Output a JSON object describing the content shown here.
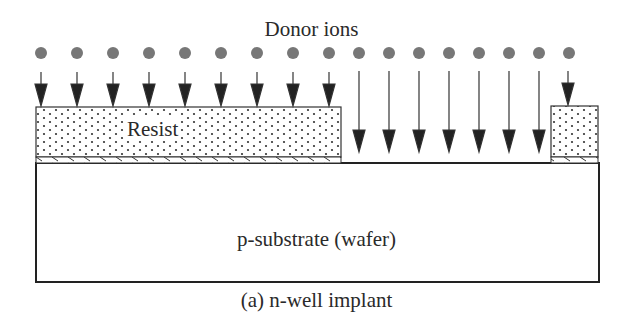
{
  "diagram": {
    "title": "Donor ions",
    "resist_label": "Resist",
    "substrate_label": "p-substrate (wafer)",
    "caption": "(a) n-well implant",
    "ion_count": 17,
    "ions_blocked_left": 9,
    "ions_blocked_right": 1,
    "ions_implanted": 7,
    "colors": {
      "ion": "#777777",
      "line": "#222222",
      "arrow": "#222222",
      "background": "#ffffff"
    }
  }
}
